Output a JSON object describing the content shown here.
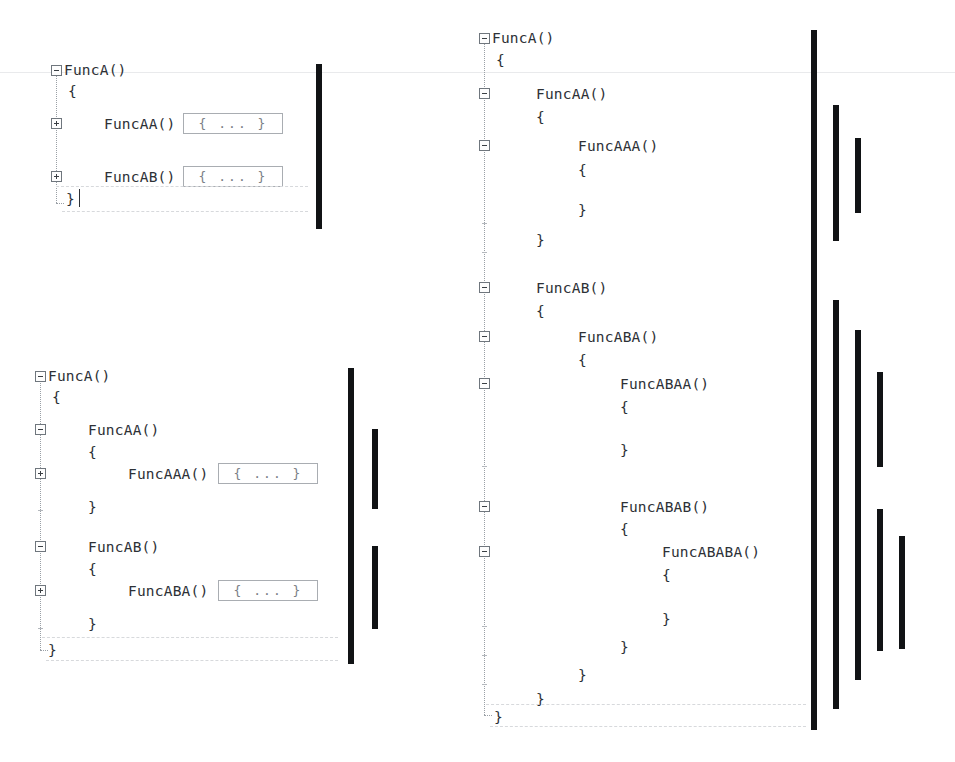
{
  "document": {
    "title": "Code folding nesting-depth illustration",
    "background_color": "#ffffff",
    "text_color": "#2d3136",
    "bar_color": "#111315",
    "chip_border_color": "#a9adb2",
    "tree_line_color": "#9aa0a6",
    "scanline_color": "#e9eaec"
  },
  "panels": [
    {
      "id": "panel-top-left",
      "name": "one-level-collapsed",
      "lines": [
        {
          "text": "FuncA()",
          "indent": 0,
          "fold": "minus"
        },
        {
          "text": "{",
          "indent": 0,
          "fold": null
        },
        {
          "text": "FuncAA()",
          "indent": 1,
          "fold": "plus",
          "chip": "{ ... }"
        },
        {
          "text": "FuncAB()",
          "indent": 1,
          "fold": "plus",
          "chip": "{ ... }"
        },
        {
          "text": "}",
          "indent": 0,
          "fold": null
        }
      ],
      "depth_bars": [
        {
          "depth": 1,
          "label": "FuncA body depth bar"
        }
      ]
    },
    {
      "id": "panel-bottom-left",
      "name": "two-levels-expanded",
      "lines": [
        {
          "text": "FuncA()",
          "indent": 0,
          "fold": "minus"
        },
        {
          "text": "{",
          "indent": 0,
          "fold": null
        },
        {
          "text": "FuncAA()",
          "indent": 1,
          "fold": "minus"
        },
        {
          "text": "{",
          "indent": 1,
          "fold": null
        },
        {
          "text": "FuncAAA()",
          "indent": 2,
          "fold": "plus",
          "chip": "{ ... }"
        },
        {
          "text": "}",
          "indent": 1,
          "fold": null
        },
        {
          "text": "FuncAB()",
          "indent": 1,
          "fold": "minus"
        },
        {
          "text": "{",
          "indent": 1,
          "fold": null
        },
        {
          "text": "FuncABA()",
          "indent": 2,
          "fold": "plus",
          "chip": "{ ... }"
        },
        {
          "text": "}",
          "indent": 1,
          "fold": null
        },
        {
          "text": "}",
          "indent": 0,
          "fold": null
        }
      ],
      "depth_bars": [
        {
          "depth": 1,
          "label": "FuncA body depth bar"
        },
        {
          "depth": 2,
          "label": "FuncAA body depth bar"
        },
        {
          "depth": 2,
          "label": "FuncAB body depth bar"
        }
      ]
    },
    {
      "id": "panel-right",
      "name": "fully-expanded",
      "lines": [
        {
          "text": "FuncA()",
          "indent": 0,
          "fold": "minus"
        },
        {
          "text": "{",
          "indent": 0,
          "fold": null
        },
        {
          "text": "FuncAA()",
          "indent": 1,
          "fold": "minus"
        },
        {
          "text": "{",
          "indent": 1,
          "fold": null
        },
        {
          "text": "FuncAAA()",
          "indent": 2,
          "fold": "minus"
        },
        {
          "text": "{",
          "indent": 2,
          "fold": null
        },
        {
          "text": "}",
          "indent": 2,
          "fold": null
        },
        {
          "text": "}",
          "indent": 1,
          "fold": null
        },
        {
          "text": "FuncAB()",
          "indent": 1,
          "fold": "minus"
        },
        {
          "text": "{",
          "indent": 1,
          "fold": null
        },
        {
          "text": "FuncABA()",
          "indent": 2,
          "fold": "minus"
        },
        {
          "text": "{",
          "indent": 2,
          "fold": null
        },
        {
          "text": "FuncABAA()",
          "indent": 3,
          "fold": "minus"
        },
        {
          "text": "{",
          "indent": 3,
          "fold": null
        },
        {
          "text": "}",
          "indent": 3,
          "fold": null
        },
        {
          "text": "FuncABAB()",
          "indent": 3,
          "fold": "minus"
        },
        {
          "text": "{",
          "indent": 3,
          "fold": null
        },
        {
          "text": "FuncABABA()",
          "indent": 4,
          "fold": "minus"
        },
        {
          "text": "{",
          "indent": 4,
          "fold": null
        },
        {
          "text": "}",
          "indent": 4,
          "fold": null
        },
        {
          "text": "}",
          "indent": 3,
          "fold": null
        },
        {
          "text": "}",
          "indent": 2,
          "fold": null
        },
        {
          "text": "}",
          "indent": 1,
          "fold": null
        },
        {
          "text": "}",
          "indent": 0,
          "fold": null
        }
      ],
      "depth_bars": [
        {
          "depth": 1,
          "label": "FuncA body depth bar"
        },
        {
          "depth": 2,
          "label": "FuncAA body depth bar"
        },
        {
          "depth": 3,
          "label": "FuncAAA body depth bar"
        },
        {
          "depth": 2,
          "label": "FuncAB body depth bar"
        },
        {
          "depth": 3,
          "label": "FuncABA body depth bar"
        },
        {
          "depth": 4,
          "label": "FuncABAA body depth bar"
        },
        {
          "depth": 4,
          "label": "FuncABAB body depth bar"
        },
        {
          "depth": 5,
          "label": "FuncABABA body depth bar"
        }
      ]
    }
  ],
  "glyphs": {
    "fold_collapsed": "+",
    "fold_expanded": "−",
    "collapsed_region": "{ ... }",
    "brace_open": "{",
    "brace_close": "}"
  },
  "p1": {
    "l0": "FuncA()",
    "l1": "{",
    "l2": "FuncAA()",
    "l3": "FuncAB()",
    "l4": "}",
    "chip2": "{ ... }",
    "chip3": "{ ... }"
  },
  "p2": {
    "l0": "FuncA()",
    "l1": "{",
    "l2": "FuncAA()",
    "l3": "{",
    "l4": "FuncAAA()",
    "l5": "}",
    "l6": "FuncAB()",
    "l7": "{",
    "l8": "FuncABA()",
    "l9": "}",
    "l10": "}",
    "chip4": "{ ... }",
    "chip8": "{ ... }"
  },
  "p3": {
    "l0": "FuncA()",
    "l1": "{",
    "l2": "FuncAA()",
    "l3": "{",
    "l4": "FuncAAA()",
    "l5": "{",
    "l6": "}",
    "l7": "}",
    "l8": "FuncAB()",
    "l9": "{",
    "l10": "FuncABA()",
    "l11": "{",
    "l12": "FuncABAA()",
    "l13": "{",
    "l14": "}",
    "l15": "FuncABAB()",
    "l16": "{",
    "l17": "FuncABABA()",
    "l18": "{",
    "l19": "}",
    "l20": "}",
    "l21": "}",
    "l22": "}",
    "l23": "}"
  }
}
